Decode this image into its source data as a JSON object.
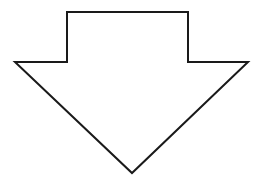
{
  "figure": {
    "name": "down-arrow-outline",
    "title": "Downward pointing arrow outline",
    "shape_type": "block-arrow",
    "direction": "down",
    "fill": "none",
    "fill_color": "#ffffff",
    "stroke_color": "#1a1a1a",
    "stroke_width": 2,
    "stroke_linejoin": "miter",
    "background_color": "#ffffff"
  },
  "canvas": {
    "width": 259,
    "height": 188
  },
  "geometry": {
    "view_box": "0 0 259 188",
    "points": "67,12 188,12 188,62 248,62 132,173 15,62 67,62",
    "path": "M 67 12 L 188 12 L 188 62 L 248 62 L 132 173 L 15 62 L 67 62 Z",
    "vertices": [
      {
        "name": "shaft-top-left",
        "x": 67,
        "y": 12
      },
      {
        "name": "shaft-top-right",
        "x": 188,
        "y": 12
      },
      {
        "name": "shoulder-right-inner",
        "x": 188,
        "y": 62
      },
      {
        "name": "barb-right-tip",
        "x": 248,
        "y": 62
      },
      {
        "name": "arrow-point-bottom",
        "x": 132,
        "y": 173
      },
      {
        "name": "barb-left-tip",
        "x": 15,
        "y": 62
      },
      {
        "name": "shoulder-left-inner",
        "x": 67,
        "y": 62
      }
    ],
    "shaft": {
      "left": 67,
      "right": 188,
      "top": 12,
      "bottom": 62,
      "width": 121,
      "height": 50
    },
    "head": {
      "left": 15,
      "right": 248,
      "top": 62,
      "bottom": 173,
      "width": 233,
      "height": 111
    }
  }
}
